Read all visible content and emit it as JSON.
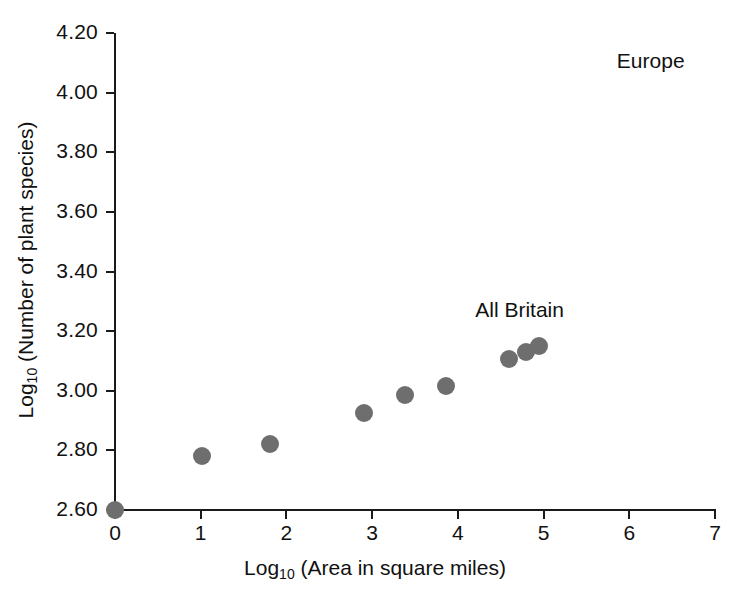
{
  "chart_data": {
    "type": "scatter",
    "title": "",
    "xlabel": "Log10 (Area in square miles)",
    "ylabel": "Log10 (Number of plant species)",
    "xlim": [
      0,
      7
    ],
    "ylim": [
      2.6,
      4.2
    ],
    "grid": false,
    "legend": null,
    "marker_color": "#6e6e6e",
    "axis_color": "#1a1a1a",
    "xticks": [
      0,
      1,
      2,
      3,
      4,
      5,
      6,
      7
    ],
    "xtick_labels": [
      "0",
      "1",
      "2",
      "3",
      "4",
      "5",
      "6",
      "7"
    ],
    "yticks": [
      2.6,
      2.8,
      3.0,
      3.2,
      3.4,
      3.6,
      3.8,
      4.0,
      4.2
    ],
    "ytick_labels": [
      "2.60",
      "2.80",
      "3.00",
      "3.20",
      "3.40",
      "3.60",
      "3.80",
      "4.00",
      "4.20"
    ],
    "points": [
      {
        "x": 0.0,
        "y": 2.6
      },
      {
        "x": 1.02,
        "y": 2.78
      },
      {
        "x": 1.81,
        "y": 2.82
      },
      {
        "x": 2.9,
        "y": 2.925
      },
      {
        "x": 3.38,
        "y": 2.985
      },
      {
        "x": 3.86,
        "y": 3.015
      },
      {
        "x": 4.6,
        "y": 3.105
      },
      {
        "x": 4.79,
        "y": 3.13
      },
      {
        "x": 4.95,
        "y": 3.15
      }
    ],
    "annotations": [
      {
        "text": "Europe",
        "x": 6.25,
        "y": 4.1
      },
      {
        "text": "All Britain",
        "x": 4.72,
        "y": 3.265
      }
    ]
  },
  "axis_titles": {
    "x_prefix": "Log",
    "x_sub": "10",
    "x_suffix": " (Area in square miles)",
    "y_prefix": "Log",
    "y_sub": "10",
    "y_suffix": " (Number of plant species)"
  }
}
